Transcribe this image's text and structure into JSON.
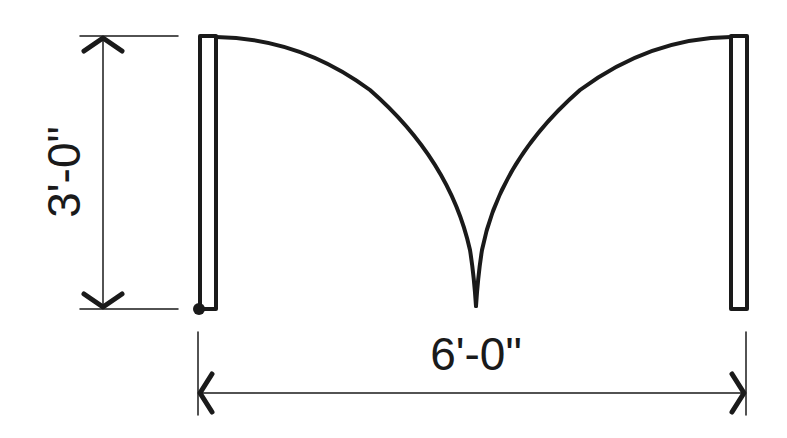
{
  "diagram": {
    "type": "double-door-plan",
    "colors": {
      "stroke": "#1a1a1a",
      "background": "#ffffff"
    },
    "dimensions": {
      "height_label": "3'-0\"",
      "width_label": "6'-0\""
    },
    "elements": [
      "left-door-leaf",
      "right-door-leaf",
      "left-swing-arc",
      "right-swing-arc",
      "hinge-point"
    ]
  }
}
